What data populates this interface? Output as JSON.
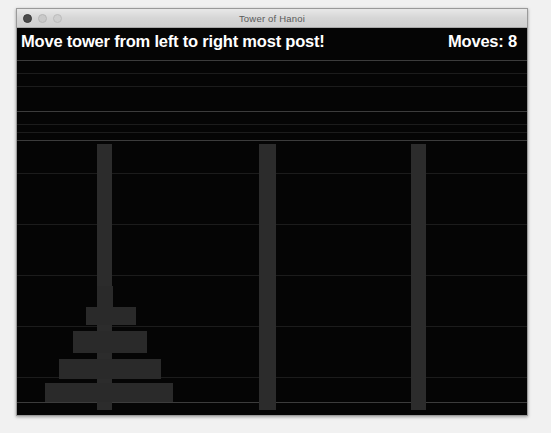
{
  "window": {
    "title": "Tower of Hanoi",
    "traffic_lights": [
      {
        "name": "close",
        "color": "#4a4a4a"
      },
      {
        "name": "minimize",
        "color": "#c9c9c9"
      },
      {
        "name": "maximize",
        "color": "#cfcfcf"
      }
    ]
  },
  "hud": {
    "message": "Move tower from left to right most post!",
    "moves_label": "Moves: 8",
    "moves_count": 8,
    "text_color": "#ffffff"
  },
  "game": {
    "background_color": "#050505",
    "post_color": "#2c2c2c",
    "disc_color": "#2a2a2a",
    "posts": [
      {
        "name": "left-post",
        "x": 80,
        "y": 116,
        "width": 15,
        "height": 266
      },
      {
        "name": "middle-post",
        "x": 242,
        "y": 116,
        "width": 17,
        "height": 266
      },
      {
        "name": "right-post",
        "x": 394,
        "y": 116,
        "width": 15,
        "height": 266
      }
    ],
    "discs": [
      {
        "name": "disc-1",
        "size": 1,
        "post": "left-post",
        "x": 80,
        "y": 258,
        "width": 16,
        "height": 21
      },
      {
        "name": "disc-2",
        "size": 2,
        "post": "left-post",
        "x": 69,
        "y": 279,
        "width": 50,
        "height": 18
      },
      {
        "name": "disc-3",
        "size": 3,
        "post": "left-post",
        "x": 56,
        "y": 303,
        "width": 74,
        "height": 22
      },
      {
        "name": "disc-4",
        "size": 4,
        "post": "left-post",
        "x": 42,
        "y": 331,
        "width": 102,
        "height": 20
      },
      {
        "name": "disc-5",
        "size": 5,
        "post": "left-post",
        "x": 28,
        "y": 355,
        "width": 128,
        "height": 19
      }
    ],
    "scanlines": [
      {
        "y": 32,
        "dim": false
      },
      {
        "y": 45,
        "dim": true
      },
      {
        "y": 58,
        "dim": true
      },
      {
        "y": 83,
        "dim": false
      },
      {
        "y": 96,
        "dim": true
      },
      {
        "y": 104,
        "dim": true
      },
      {
        "y": 112,
        "dim": false
      },
      {
        "y": 145,
        "dim": true
      },
      {
        "y": 196,
        "dim": true
      },
      {
        "y": 247,
        "dim": true
      },
      {
        "y": 298,
        "dim": true
      },
      {
        "y": 349,
        "dim": true
      },
      {
        "y": 374,
        "dim": false
      }
    ]
  }
}
